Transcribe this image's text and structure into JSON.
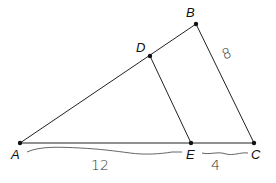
{
  "diagram": {
    "type": "geometry-similar-triangles",
    "points": {
      "A": {
        "label": "A",
        "x": 20,
        "y": 143
      },
      "B": {
        "label": "B",
        "x": 196,
        "y": 24
      },
      "C": {
        "label": "C",
        "x": 254,
        "y": 143
      },
      "D": {
        "label": "D",
        "x": 150,
        "y": 56
      },
      "E": {
        "label": "E",
        "x": 191,
        "y": 143
      }
    },
    "segments": [
      {
        "from": "A",
        "to": "B"
      },
      {
        "from": "B",
        "to": "C"
      },
      {
        "from": "A",
        "to": "C"
      },
      {
        "from": "D",
        "to": "E"
      }
    ],
    "measurements": {
      "AE": "12",
      "EC": "4",
      "BC": "8"
    },
    "colors": {
      "line": "#222222",
      "text": "#111111",
      "handwriting": "#444444"
    }
  }
}
